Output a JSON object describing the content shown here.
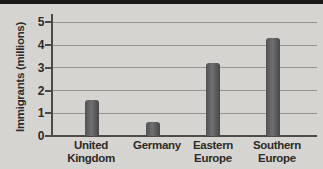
{
  "page": {
    "background_color": "#d6d4d0",
    "top_strip_color": "#1b1918"
  },
  "chart_data": {
    "type": "bar",
    "title": "",
    "xlabel": "",
    "ylabel": "Immigrants (millions)",
    "categories": [
      "United Kingdom",
      "Germany",
      "Eastern Europe",
      "Southern Europe"
    ],
    "category_lines": [
      [
        "United",
        "Kingdom"
      ],
      [
        "Germany"
      ],
      [
        "Eastern",
        "Europe"
      ],
      [
        "Southern",
        "Europe"
      ]
    ],
    "values": [
      1.6,
      0.6,
      3.2,
      4.3
    ],
    "yticks": [
      0,
      1,
      2,
      3,
      4,
      5
    ],
    "ylim": [
      0,
      5.35
    ],
    "grid": true,
    "legend_position": "none",
    "colors": {
      "bar": "#58585a",
      "grid": "#96948f",
      "axis": "#4e4a46",
      "text": "#2d2a27"
    },
    "layout": {
      "bar_centers_px": [
        91.5,
        152.5,
        212.5,
        272.5
      ],
      "label_centers_px": [
        91,
        157,
        213,
        277
      ],
      "bar_width_px": 14,
      "plot_left_px": 52,
      "plot_right_px": 317,
      "baseline_y_px": 136,
      "px_per_unit": 22.72
    }
  }
}
